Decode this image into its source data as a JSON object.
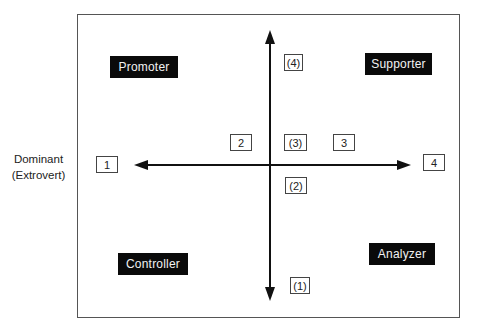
{
  "diagram": {
    "type": "quadrant",
    "side_label": {
      "line1": "Dominant",
      "line2": "(Extrovert)"
    },
    "quadrants": {
      "top_left": "Promoter",
      "top_right": "Supporter",
      "bottom_left": "Controller",
      "bottom_right": "Analyzer"
    },
    "horizontal_axis_markers": {
      "left_end": "1",
      "left_inner": "2",
      "right_inner": "3",
      "right_end": "4"
    },
    "vertical_axis_markers": {
      "top_end": "(4)",
      "top_inner": "(3)",
      "bottom_inner": "(2)",
      "bottom_end": "(1)"
    },
    "colors": {
      "label_background": "#0a0a0a",
      "label_text": "#f2f2f2",
      "axis": "#111111",
      "frame": "#555555"
    }
  }
}
